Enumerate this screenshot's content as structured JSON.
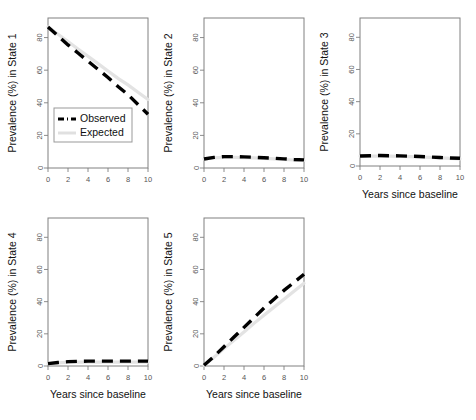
{
  "figure": {
    "width": 476,
    "height": 420,
    "background": "#ffffff",
    "layout": "2 rows x 3 columns, 5 panels"
  },
  "legend": {
    "observed_label": "Observed",
    "expected_label": "Expected",
    "observed_color": "#000000",
    "expected_color": "#e3e3e3",
    "position": "bottom-left of panel 1"
  },
  "axis": {
    "xlabel": "Years since baseline",
    "xticks": [
      0,
      2,
      4,
      6,
      8,
      10
    ],
    "yticks": [
      0,
      20,
      40,
      60,
      80
    ],
    "xlim": [
      0,
      10
    ],
    "ylim": [
      0,
      92
    ]
  },
  "chart_data": {
    "type": "line",
    "title": "",
    "xlabel": "Years since baseline",
    "ylabel": "Prevalence (%)",
    "xlim": [
      0,
      10
    ],
    "ylim": [
      0,
      92
    ],
    "xticks": [
      0,
      2,
      4,
      6,
      8,
      10
    ],
    "yticks": [
      0,
      20,
      40,
      60,
      80
    ],
    "grid": false,
    "legend_position": "panel-1 bottom-left",
    "legend_entries": [
      "Observed",
      "Expected"
    ],
    "panels": [
      {
        "id": "state-1",
        "ylabel": "Prevalence (%) in State 1",
        "xlabel": "",
        "x": [
          0,
          1,
          2,
          3,
          4,
          5,
          6,
          7,
          8,
          9,
          10
        ],
        "series": [
          {
            "name": "Observed",
            "values": [
              86.5,
              81.0,
              75.5,
              70.5,
              65.5,
              60.5,
              55.5,
              50.0,
              45.0,
              39.0,
              33.0
            ]
          },
          {
            "name": "Expected",
            "values": [
              86.5,
              82.0,
              77.5,
              73.0,
              68.5,
              64.0,
              59.5,
              55.0,
              51.0,
              46.5,
              42.0
            ]
          }
        ]
      },
      {
        "id": "state-2",
        "ylabel": "Prevalence (%) in State 2",
        "xlabel": "",
        "x": [
          0,
          1,
          2,
          3,
          4,
          5,
          6,
          7,
          8,
          9,
          10
        ],
        "series": [
          {
            "name": "Observed",
            "values": [
              5.5,
              6.5,
              7.0,
              7.0,
              6.8,
              6.6,
              6.3,
              6.0,
              5.6,
              5.2,
              5.0
            ]
          },
          {
            "name": "Expected",
            "values": [
              5.5,
              6.2,
              6.5,
              6.5,
              6.4,
              6.2,
              5.9,
              5.6,
              5.2,
              4.9,
              4.6
            ]
          }
        ]
      },
      {
        "id": "state-3",
        "ylabel": "Prevalence (%) in State 3",
        "xlabel": "Years since baseline",
        "x": [
          0,
          1,
          2,
          3,
          4,
          5,
          6,
          7,
          8,
          9,
          10
        ],
        "series": [
          {
            "name": "Observed",
            "values": [
              6.2,
              6.4,
              6.5,
              6.4,
              6.3,
              6.1,
              5.9,
              5.6,
              5.3,
              5.0,
              4.8
            ]
          },
          {
            "name": "Expected",
            "values": [
              6.2,
              6.2,
              6.2,
              6.1,
              6.0,
              5.8,
              5.6,
              5.3,
              5.0,
              4.7,
              4.4
            ]
          }
        ]
      },
      {
        "id": "state-4",
        "ylabel": "Prevalence (%) in State 4",
        "xlabel": "Years since baseline",
        "x": [
          0,
          1,
          2,
          3,
          4,
          5,
          6,
          7,
          8,
          9,
          10
        ],
        "series": [
          {
            "name": "Observed",
            "values": [
              1.5,
              2.2,
              2.7,
              2.9,
              3.0,
              3.0,
              3.0,
              3.0,
              3.0,
              3.0,
              3.0
            ]
          },
          {
            "name": "Expected",
            "values": [
              1.5,
              2.0,
              2.3,
              2.4,
              2.4,
              2.4,
              2.4,
              2.4,
              2.4,
              2.4,
              2.4
            ]
          }
        ]
      },
      {
        "id": "state-5",
        "ylabel": "Prevalence (%) in State 5",
        "xlabel": "Years since baseline",
        "x": [
          0,
          1,
          2,
          3,
          4,
          5,
          6,
          7,
          8,
          9,
          10
        ],
        "series": [
          {
            "name": "Observed",
            "values": [
              0.5,
              6.0,
              12.0,
              18.0,
              24.0,
              30.0,
              36.0,
              41.5,
              47.0,
              52.0,
              57.0
            ]
          },
          {
            "name": "Expected",
            "values": [
              0.5,
              5.5,
              10.8,
              16.0,
              21.2,
              26.5,
              31.5,
              36.5,
              41.5,
              46.5,
              51.5
            ]
          }
        ]
      }
    ]
  }
}
